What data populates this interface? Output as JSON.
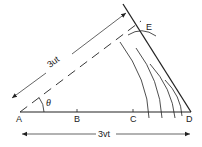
{
  "diagram": {
    "type": "huygens-wavefront-construction",
    "points": {
      "A": {
        "label": "A",
        "x": 20,
        "y": 112
      },
      "B": {
        "label": "B",
        "x": 77,
        "y": 112
      },
      "C": {
        "label": "C",
        "x": 133,
        "y": 112
      },
      "D": {
        "label": "D",
        "x": 191,
        "y": 112
      },
      "E": {
        "label": "E",
        "x": 148,
        "y": 24
      }
    },
    "angle_label": "θ",
    "dimension_labels": {
      "hypotenuse": "3ut",
      "base": "3vt"
    },
    "colors": {
      "line": "#222222",
      "background": "#ffffff"
    }
  }
}
